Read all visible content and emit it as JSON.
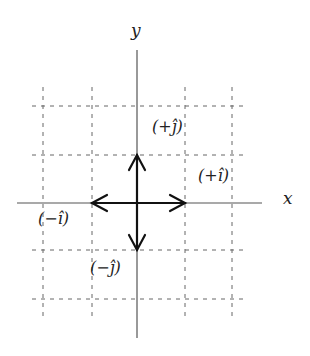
{
  "diagram": {
    "axes": {
      "x_label": "x",
      "y_label": "y"
    },
    "vectors": [
      {
        "name": "plus-i",
        "label": "(+î)",
        "direction": "right"
      },
      {
        "name": "minus-i",
        "label": "(−î)",
        "direction": "left"
      },
      {
        "name": "plus-j",
        "label": "(+ĵ)",
        "direction": "up"
      },
      {
        "name": "minus-j",
        "label": "(−ĵ)",
        "direction": "down"
      }
    ],
    "grid": {
      "style": "dashed",
      "columns": 4,
      "rows": 4
    },
    "colors": {
      "axis": "#555555",
      "grid": "#666666",
      "vector": "#111111",
      "background": "#ffffff"
    }
  }
}
